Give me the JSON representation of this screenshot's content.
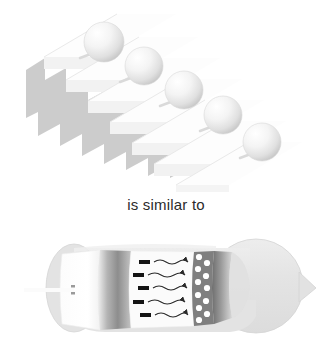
{
  "figure": {
    "title_text": "is similar to",
    "caption": {
      "text": "is similar to",
      "color": "#2b2b2b",
      "font_size_px": 15,
      "center_x": 166,
      "baseline_y": 212
    },
    "panels": [
      {
        "id": "staircase-panel",
        "name": "staircase-with-spheres",
        "description": "Descending staircase drawn in light grey with five white spheres resting on successive steps",
        "bbox": [
          18,
          4,
          300,
          186
        ],
        "step_count": 8,
        "step_fill": "#ffffff",
        "step_shadow": "#c9c9c9",
        "step_edge": "#e2e2e2",
        "spheres": [
          {
            "label": "sphere-1",
            "cx": 104,
            "cy": 42,
            "r": 20
          },
          {
            "label": "sphere-2",
            "cx": 144,
            "cy": 66,
            "r": 19
          },
          {
            "label": "sphere-3",
            "cx": 184,
            "cy": 90,
            "r": 19
          },
          {
            "label": "sphere-4",
            "cx": 223,
            "cy": 115,
            "r": 19
          },
          {
            "label": "sphere-5",
            "cx": 262,
            "cy": 142,
            "r": 19
          }
        ],
        "sphere_fill_light": "#ffffff",
        "sphere_fill_mid": "#ececec",
        "sphere_fill_dark": "#cfcfcf"
      },
      {
        "id": "cylinder-panel",
        "name": "cutaway-cylinder-diagram",
        "description": "Horizontal cutaway tube with a rounded left cap, a white inner disc pierced by a rod, a dark gradient collar, a white chamber containing dark dashes with wavy arrows, a porous band of white circles, a second dark collar and a large rounded right bulb with a small nub",
        "bbox": [
          24,
          232,
          308,
          106
        ],
        "body_fill": "#e3e3e3",
        "body_edge": "#d2d2d2",
        "chamber_fill": "#fbfbfb",
        "collar_dark": "#8f8f8f",
        "collar_light": "#e8e8e8",
        "pore_fill": "#ffffff",
        "dash_color": "#141414",
        "arrow_color": "#2a2a2a",
        "rod": {
          "name": "inlet-rod",
          "x1": 24,
          "x2": 72,
          "y": 290,
          "thickness": 4
        },
        "left_cap": {
          "cx": 74,
          "cy": 288,
          "rx": 26,
          "ry": 43
        },
        "right_bulb": {
          "cx": 258,
          "cy": 286,
          "rx": 48,
          "ry": 48
        },
        "nub": {
          "cx": 312,
          "cy": 289,
          "r": 7
        },
        "inner_disc": {
          "x": 62,
          "y": 252,
          "w": 38,
          "h": 74
        },
        "collar_1": {
          "x": 97,
          "y": 251,
          "w": 32,
          "h": 78
        },
        "white_chamber": {
          "x": 128,
          "y": 250,
          "w": 66,
          "h": 80
        },
        "pore_band": {
          "x": 192,
          "y": 250,
          "w": 22,
          "h": 78
        },
        "collar_2": {
          "x": 208,
          "y": 249,
          "w": 20,
          "h": 80
        },
        "flow_rows": [
          {
            "row": 1,
            "dash_x": 140,
            "y": 262,
            "arrow_end_x": 190
          },
          {
            "row": 2,
            "dash_x": 133,
            "y": 272,
            "arrow_end_x": 190
          },
          {
            "row": 3,
            "dash_x": 138,
            "y": 286,
            "arrow_end_x": 190
          },
          {
            "row": 4,
            "dash_x": 133,
            "y": 300,
            "arrow_end_x": 190
          },
          {
            "row": 5,
            "dash_x": 140,
            "y": 312,
            "arrow_end_x": 190
          }
        ],
        "pores": [
          {
            "cx": 198,
            "cy": 257,
            "r": 3
          },
          {
            "cx": 206,
            "cy": 262,
            "r": 3
          },
          {
            "cx": 197,
            "cy": 267,
            "r": 3
          },
          {
            "cx": 205,
            "cy": 274,
            "r": 3
          },
          {
            "cx": 197,
            "cy": 280,
            "r": 3
          },
          {
            "cx": 206,
            "cy": 286,
            "r": 3
          },
          {
            "cx": 197,
            "cy": 292,
            "r": 3
          },
          {
            "cx": 205,
            "cy": 299,
            "r": 3
          },
          {
            "cx": 198,
            "cy": 306,
            "r": 3
          },
          {
            "cx": 206,
            "cy": 312,
            "r": 3
          },
          {
            "cx": 198,
            "cy": 318,
            "r": 3
          }
        ]
      }
    ]
  }
}
